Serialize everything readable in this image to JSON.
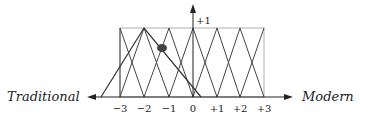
{
  "diagram": {
    "left_label": "Traditional",
    "right_label": "Modern",
    "y_label": "+1",
    "ticks": [
      "−3",
      "−2",
      "−1",
      "0",
      "+1",
      "+2",
      "+3"
    ],
    "tick_values": [
      -3,
      -2,
      -1,
      0,
      1,
      2,
      3
    ],
    "membership_functions": "triangular, centered on each integer from -3 to +3, width 2, peak height 1",
    "highlight_triangle": {
      "left_foot": -3.8,
      "peak": -2,
      "right_foot": 0.35
    },
    "marker_point": {
      "x": -1.3,
      "y": 0.72
    },
    "colors": {
      "line": "#333333",
      "box": "#aaaaaa",
      "marker": "#444444"
    }
  }
}
